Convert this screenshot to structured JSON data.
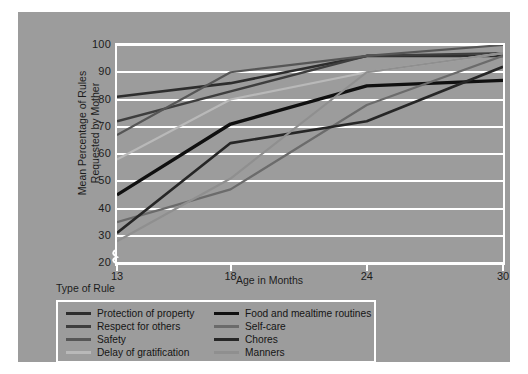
{
  "figure": {
    "page_background": "#ffffff",
    "canvas_background": "#9c9c9c",
    "gridline_color": "#ffffff",
    "frame_color": "#ffffff"
  },
  "axes": {
    "ylabel_line1": "Mean Percentage of Rules",
    "ylabel_line2": "Requested by Mother",
    "xlabel": "Age in Months",
    "yticks": [
      100,
      90,
      80,
      70,
      60,
      50,
      40,
      30,
      20
    ],
    "xticks": [
      13,
      18,
      24,
      30
    ],
    "axis_break_symbol": "axis-break"
  },
  "legend": {
    "title": "Type of Rule",
    "entries": [
      {
        "label": "Protection of property",
        "color": "#2d2d2d",
        "width": 2.6
      },
      {
        "label": "Food and mealtime routines",
        "color": "#101010",
        "width": 3.4
      },
      {
        "label": "Respect for others",
        "color": "#3e3e3e",
        "width": 2.4
      },
      {
        "label": "Self-care",
        "color": "#6b6b6b",
        "width": 2.2
      },
      {
        "label": "Safety",
        "color": "#565656",
        "width": 2.2
      },
      {
        "label": "Chores",
        "color": "#262626",
        "width": 2.6
      },
      {
        "label": "Delay of gratification",
        "color": "#b9b9b9",
        "width": 2.2
      },
      {
        "label": "Manners",
        "color": "#8f8f8f",
        "width": 2.2
      }
    ]
  },
  "chart_data": {
    "type": "line",
    "title": "",
    "xlabel": "Age in Months",
    "ylabel": "Mean Percentage of Rules Requested by Mother",
    "x": [
      13,
      18,
      24,
      30
    ],
    "xlim": [
      13,
      30
    ],
    "ylim": [
      20,
      100
    ],
    "grid": true,
    "legend_position": "below-left",
    "series": [
      {
        "name": "Protection of property",
        "color": "#2d2d2d",
        "width": 2.6,
        "values": [
          81,
          86,
          96,
          96
        ]
      },
      {
        "name": "Respect for others",
        "color": "#3e3e3e",
        "width": 2.4,
        "values": [
          72,
          83,
          96,
          97
        ]
      },
      {
        "name": "Safety",
        "color": "#565656",
        "width": 2.2,
        "values": [
          67,
          90,
          96,
          100
        ]
      },
      {
        "name": "Delay of gratification",
        "color": "#b9b9b9",
        "width": 2.2,
        "values": [
          58,
          80,
          90,
          97
        ]
      },
      {
        "name": "Food and mealtime routines",
        "color": "#101010",
        "width": 3.4,
        "values": [
          45,
          71,
          85,
          87
        ]
      },
      {
        "name": "Self-care",
        "color": "#6b6b6b",
        "width": 2.2,
        "values": [
          35,
          47,
          78,
          96
        ]
      },
      {
        "name": "Chores",
        "color": "#262626",
        "width": 2.6,
        "values": [
          31,
          64,
          72,
          92
        ]
      },
      {
        "name": "Manners",
        "color": "#8f8f8f",
        "width": 2.2,
        "values": [
          28,
          51,
          90,
          97
        ]
      }
    ]
  }
}
